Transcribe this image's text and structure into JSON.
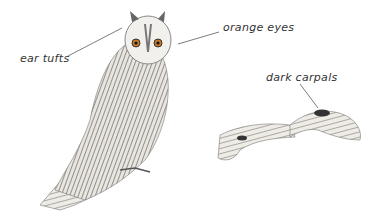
{
  "labels": {
    "ear_tufts": "ear tufts",
    "orange_eyes": "orange eyes",
    "dark_carpals": "dark carpals"
  },
  "subjects": [
    "perched long-eared owl",
    "long-eared owl in flight"
  ]
}
